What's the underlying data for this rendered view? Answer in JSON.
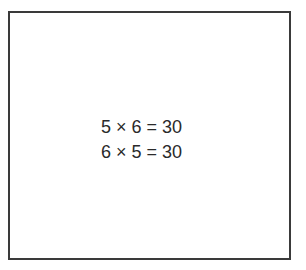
{
  "figure": {
    "equations": [
      "5 × 6 = 30",
      "6 × 5 = 30"
    ],
    "colors": {
      "border": "#3a3a3a",
      "text": "#2a2a2a",
      "background": "#ffffff"
    }
  }
}
